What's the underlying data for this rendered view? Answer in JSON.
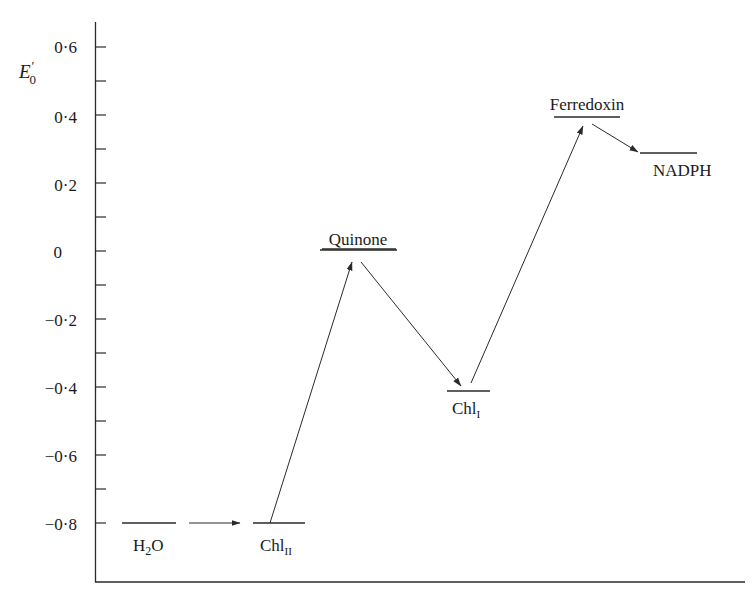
{
  "chart_data": {
    "type": "energy-level-diagram",
    "title": "",
    "ylabel": "E'0",
    "ylabel_main": "E",
    "ylabel_sup": "′",
    "ylabel_sub": "0",
    "xlabel": "",
    "ylim": [
      -0.9,
      0.65
    ],
    "y_ticks": [
      0.6,
      0.5,
      0.4,
      0.3,
      0.2,
      0.1,
      0,
      -0.1,
      -0.2,
      -0.3,
      -0.4,
      -0.5,
      -0.6,
      -0.7,
      -0.8
    ],
    "y_tick_labels": [
      {
        "value": 0.6,
        "label": "0·6"
      },
      {
        "value": 0.4,
        "label": "0·4"
      },
      {
        "value": 0.2,
        "label": "0·2"
      },
      {
        "value": 0,
        "label": "0"
      },
      {
        "value": -0.2,
        "label": "−0·2"
      },
      {
        "value": -0.4,
        "label": "−0·4"
      },
      {
        "value": -0.6,
        "label": "−0·6"
      },
      {
        "value": -0.8,
        "label": "−0·8"
      }
    ],
    "levels": [
      {
        "name": "H2O",
        "label_main": "H",
        "label_sub": "2",
        "label_tail": "O",
        "value": -0.8,
        "label_position": "below",
        "underlined": false
      },
      {
        "name": "ChlII",
        "label_main": "Chl",
        "label_sub": "II",
        "label_tail": "",
        "value": -0.8,
        "label_position": "below",
        "underlined": false
      },
      {
        "name": "Quinone",
        "label_main": "Quinone",
        "label_sub": "",
        "label_tail": "",
        "value": 0.0,
        "label_position": "above",
        "underlined": true
      },
      {
        "name": "ChlI",
        "label_main": "Chl",
        "label_sub": "I",
        "label_tail": "",
        "value": -0.42,
        "label_position": "below",
        "underlined": false
      },
      {
        "name": "Ferredoxin",
        "label_main": "Ferredoxin",
        "label_sub": "",
        "label_tail": "",
        "value": 0.4,
        "label_position": "above",
        "underlined": true
      },
      {
        "name": "NADPH",
        "label_main": "NADPH",
        "label_sub": "",
        "label_tail": "",
        "value": 0.29,
        "label_position": "below",
        "underlined": false
      }
    ],
    "transitions": [
      {
        "from": "H2O",
        "to": "ChlII"
      },
      {
        "from": "ChlII",
        "to": "Quinone"
      },
      {
        "from": "Quinone",
        "to": "ChlI"
      },
      {
        "from": "ChlI",
        "to": "Ferredoxin"
      },
      {
        "from": "Ferredoxin",
        "to": "NADPH"
      }
    ],
    "grid": false,
    "legend": null
  },
  "colors": {
    "ink": "#2a2a2a",
    "background": "#ffffff"
  }
}
